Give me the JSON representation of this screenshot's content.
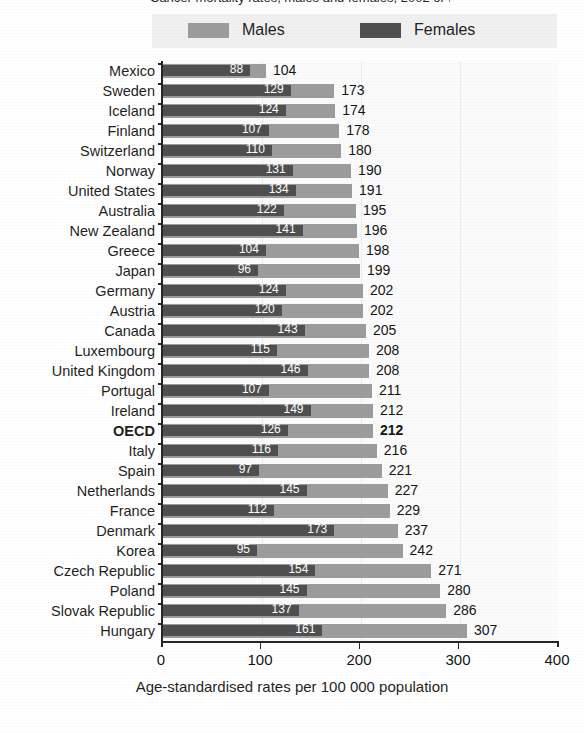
{
  "chart_data": {
    "type": "bar",
    "orientation": "horizontal",
    "title": "",
    "xlabel": "Age-standardised rates per 100 000 population",
    "ylabel": "",
    "xlim": [
      0,
      400
    ],
    "xticks": [
      0,
      100,
      200,
      300,
      400
    ],
    "grid": true,
    "legend_position": "top",
    "bar_style": "overlaid",
    "categories": [
      "Mexico",
      "Sweden",
      "Iceland",
      "Finland",
      "Switzerland",
      "Norway",
      "United States",
      "Australia",
      "New Zealand",
      "Greece",
      "Japan",
      "Germany",
      "Austria",
      "Canada",
      "Luxembourg",
      "United Kingdom",
      "Portugal",
      "Ireland",
      "OECD",
      "Italy",
      "Spain",
      "Netherlands",
      "France",
      "Denmark",
      "Korea",
      "Czech Republic",
      "Poland",
      "Slovak Republic",
      "Hungary"
    ],
    "highlight_category": "OECD",
    "series": [
      {
        "name": "Males",
        "color": "#9c9c9c",
        "values": [
          104,
          173,
          174,
          178,
          180,
          190,
          191,
          195,
          196,
          198,
          199,
          202,
          202,
          205,
          208,
          208,
          211,
          212,
          212,
          216,
          221,
          227,
          229,
          237,
          242,
          271,
          280,
          286,
          307
        ]
      },
      {
        "name": "Females",
        "color": "#4f4f4f",
        "values": [
          88,
          129,
          124,
          107,
          110,
          131,
          134,
          122,
          141,
          104,
          96,
          124,
          120,
          143,
          115,
          146,
          107,
          149,
          126,
          116,
          97,
          145,
          112,
          173,
          95,
          154,
          145,
          137,
          161
        ]
      }
    ]
  },
  "legend": {
    "males_label": "Males",
    "females_label": "Females"
  },
  "axis": {
    "title": "Age-standardised rates per 100 000 population",
    "ticks": [
      "0",
      "100",
      "200",
      "300",
      "400"
    ]
  },
  "title_remnant": "Cancer mortality rates, males and females, 2002 or latest year available"
}
